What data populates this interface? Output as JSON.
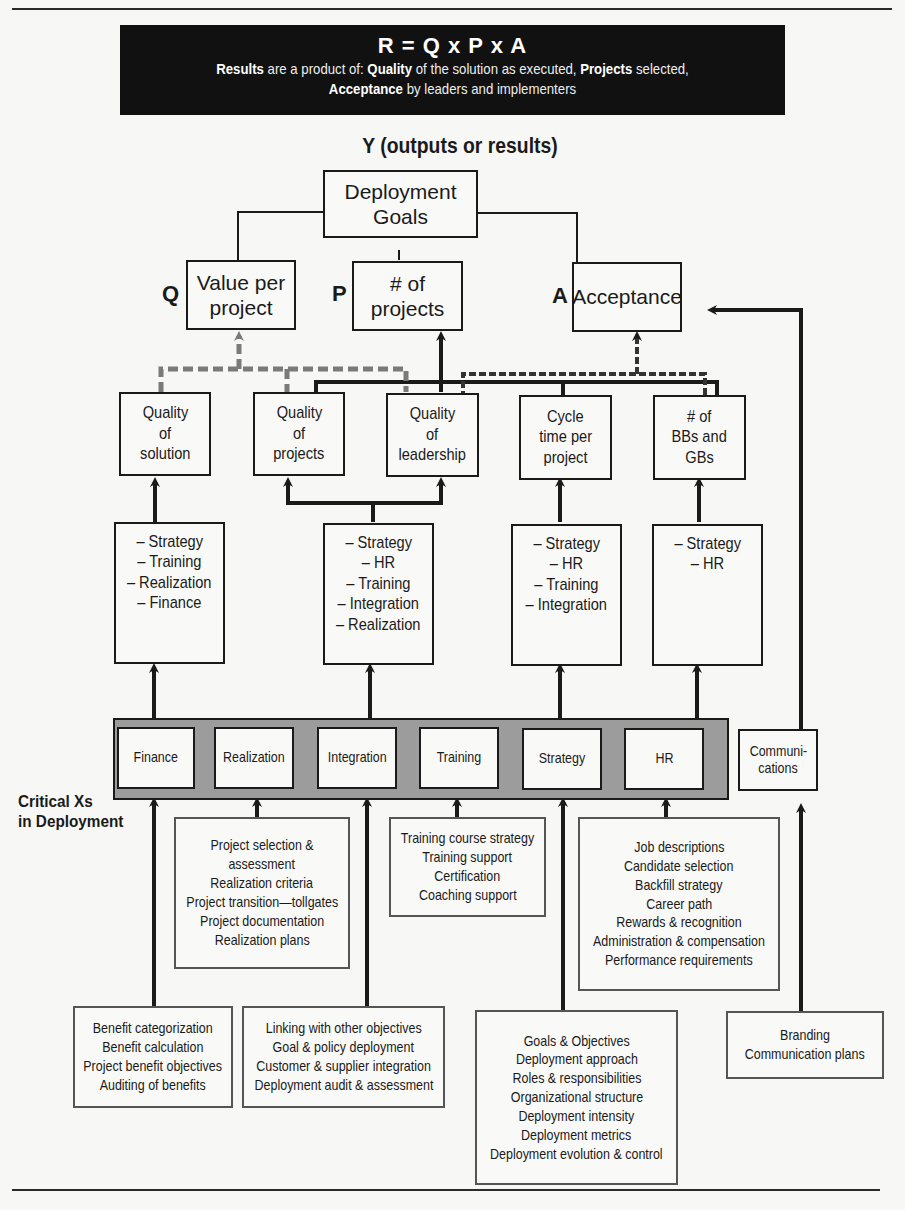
{
  "banner": {
    "formula": "R = Q x P x A",
    "line1": [
      {
        "text": "Results",
        "bold": true
      },
      {
        "text": " are a product of: ",
        "bold": false
      },
      {
        "text": "Quality",
        "bold": true
      },
      {
        "text": " of the solution as executed, ",
        "bold": false
      },
      {
        "text": "Projects",
        "bold": true
      },
      {
        "text": " selected,",
        "bold": false
      }
    ],
    "line2": [
      {
        "text": "Acceptance",
        "bold": true
      },
      {
        "text": " by leaders and implementers",
        "bold": false
      }
    ]
  },
  "y_title": "Y (outputs or results)",
  "top": {
    "goal": [
      "Deployment",
      "Goals"
    ],
    "outputs": [
      {
        "letter": "Q",
        "lines": [
          "Value per",
          "project"
        ]
      },
      {
        "letter": "P",
        "lines": [
          "# of",
          "projects"
        ]
      },
      {
        "letter": "A",
        "lines": [
          "Acceptance"
        ]
      }
    ]
  },
  "drivers": [
    {
      "lines": [
        "Quality",
        "of",
        "solution"
      ]
    },
    {
      "lines": [
        "Quality",
        "of",
        "projects"
      ]
    },
    {
      "lines": [
        "Quality",
        "of",
        "leadership"
      ]
    },
    {
      "lines": [
        "Cycle",
        "time per",
        "project"
      ]
    },
    {
      "lines": [
        "# of",
        "BBs and",
        "GBs"
      ]
    }
  ],
  "contributors": [
    {
      "lines": [
        "– Strategy",
        "– Training",
        "– Realization",
        "– Finance"
      ]
    },
    {
      "lines": [
        "– Strategy",
        "– HR",
        "– Training",
        "– Integration",
        "– Realization"
      ]
    },
    {
      "lines": [
        "– Strategy",
        "– HR",
        "– Training",
        "– Integration"
      ]
    },
    {
      "lines": [
        "– Strategy",
        "– HR"
      ]
    }
  ],
  "critical_xs": {
    "label": [
      "Critical Xs",
      "in Deployment"
    ],
    "items": [
      "Finance",
      "Realization",
      "Integration",
      "Training",
      "Strategy",
      "HR"
    ],
    "communications": [
      "Communi-",
      "cations"
    ]
  },
  "details": {
    "finance": [
      "Benefit categorization",
      "Benefit calculation",
      "Project benefit objectives",
      "Auditing of benefits"
    ],
    "realization": [
      "Project selection &",
      "assessment",
      "Realization criteria",
      "Project transition—tollgates",
      "Project documentation",
      "Realization plans"
    ],
    "integration": [
      "Linking with other objectives",
      "Goal & policy deployment",
      "Customer & supplier integration",
      "Deployment audit & assessment"
    ],
    "training": [
      "Training course strategy",
      "Training support",
      "Certification",
      "Coaching support"
    ],
    "strategy": [
      "Goals & Objectives",
      "Deployment approach",
      "Roles & responsibilities",
      "Organizational structure",
      "Deployment intensity",
      "Deployment metrics",
      "Deployment evolution & control"
    ],
    "hr": [
      "Job descriptions",
      "Candidate selection",
      "Backfill strategy",
      "Career path",
      "Rewards & recognition",
      "Administration & compensation",
      "Performance requirements"
    ],
    "communications": [
      "Branding",
      "Communication plans"
    ]
  },
  "colors": {
    "ink": "#1a1a1a",
    "dashed_gray": "#7a7a7a",
    "band_gray": "#9c9c9c",
    "banner_bg": "#111111"
  }
}
